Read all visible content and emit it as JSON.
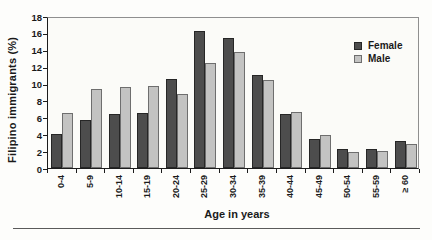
{
  "chart_data": {
    "type": "bar",
    "title": "",
    "xlabel": "Age in years",
    "ylabel": "Filipino immigrants (%)",
    "categories": [
      "0-4",
      "5-9",
      "10-14",
      "15-19",
      "20-24",
      "25-29",
      "30-34",
      "35-39",
      "40-44",
      "45-49",
      "50-54",
      "55-59",
      "≥ 60"
    ],
    "series": [
      {
        "name": "Female",
        "color": "#4d4d4d",
        "border": "#262626",
        "values": [
          4.0,
          5.7,
          6.4,
          6.5,
          10.6,
          16.2,
          15.4,
          11.0,
          6.4,
          3.4,
          2.2,
          2.2,
          3.2
        ]
      },
      {
        "name": "Male",
        "color": "#c3c3c2",
        "border": "#6e6e6e",
        "values": [
          6.5,
          9.3,
          9.6,
          9.7,
          8.8,
          12.4,
          13.7,
          10.4,
          6.6,
          3.9,
          1.9,
          2.0,
          2.9
        ]
      }
    ],
    "ylim": [
      0,
      18
    ],
    "yticks": [
      0,
      2,
      4,
      6,
      8,
      10,
      12,
      14,
      16,
      18
    ],
    "grid": false,
    "legend_position": "upper-right"
  },
  "colors": {
    "axis": "#1c1c1c",
    "frame": "#8f8f8f",
    "text": "#1a1a1a",
    "background": "#fdfdfb",
    "rule": "#5a5a5a"
  }
}
